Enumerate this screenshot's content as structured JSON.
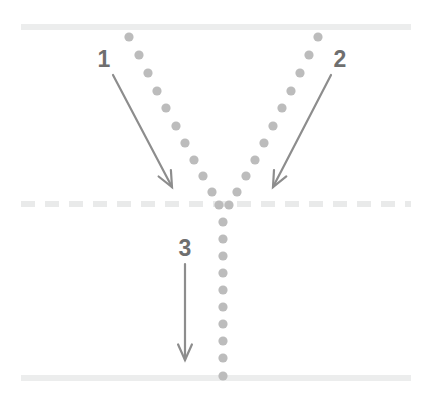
{
  "figure": {
    "title": "",
    "width": 431,
    "height": 402,
    "background": "#ffffff"
  },
  "colors": {
    "guide_line_solid": "#eceded",
    "guide_line_dashed": "#e9eaea",
    "track_dot": "#bcbcbc",
    "arrow": "#8d8d8d",
    "label_text": "#6f6f6f"
  },
  "guide_lines": [
    {
      "name": "top-solid-line",
      "style": "solid",
      "x1": 21,
      "y1": 27,
      "x2": 411,
      "y2": 27,
      "thickness": 6,
      "color": "#eceded"
    },
    {
      "name": "middle-dashed-line",
      "style": "dashed",
      "x1": 21,
      "y1": 204,
      "x2": 411,
      "y2": 204,
      "thickness": 6,
      "color": "#e9eaea",
      "dash": "14 10"
    },
    {
      "name": "bottom-solid-line",
      "style": "solid",
      "x1": 21,
      "y1": 378,
      "x2": 411,
      "y2": 378,
      "thickness": 6,
      "color": "#eceded"
    }
  ],
  "dot_tracks": [
    {
      "name": "left-branch-dot-track",
      "dot_radius": 4.6,
      "color": "#bcbcbc",
      "points": [
        [
          129,
          37
        ],
        [
          139,
          55
        ],
        [
          148,
          73
        ],
        [
          157,
          91
        ],
        [
          166,
          108
        ],
        [
          176,
          126
        ],
        [
          185,
          143
        ],
        [
          194,
          160
        ],
        [
          203,
          176
        ],
        [
          212,
          192
        ],
        [
          219,
          205
        ]
      ]
    },
    {
      "name": "right-branch-dot-track",
      "dot_radius": 4.6,
      "color": "#bcbcbc",
      "points": [
        [
          318,
          37
        ],
        [
          309,
          55
        ],
        [
          300,
          73
        ],
        [
          291,
          91
        ],
        [
          282,
          108
        ],
        [
          273,
          126
        ],
        [
          264,
          143
        ],
        [
          255,
          160
        ],
        [
          246,
          176
        ],
        [
          237,
          192
        ],
        [
          229,
          205
        ]
      ]
    },
    {
      "name": "merged-stem-dot-track",
      "dot_radius": 4.6,
      "color": "#bcbcbc",
      "points": [
        [
          223,
          222
        ],
        [
          223,
          239
        ],
        [
          223,
          256
        ],
        [
          223,
          273
        ],
        [
          223,
          290
        ],
        [
          223,
          307
        ],
        [
          223,
          324
        ],
        [
          223,
          341
        ],
        [
          223,
          358
        ],
        [
          223,
          376
        ]
      ]
    }
  ],
  "annotations": [
    {
      "id": "1",
      "name": "annotation-1",
      "label": "1",
      "label_x": 104,
      "label_y": 67,
      "arrow": {
        "x1": 113,
        "y1": 75,
        "x2": 172,
        "y2": 187
      },
      "head_size": 17
    },
    {
      "id": "2",
      "name": "annotation-2",
      "label": "2",
      "label_x": 340,
      "label_y": 67,
      "arrow": {
        "x1": 331,
        "y1": 75,
        "x2": 273,
        "y2": 187
      },
      "head_size": 17
    },
    {
      "id": "3",
      "name": "annotation-3",
      "label": "3",
      "label_x": 185,
      "label_y": 256,
      "arrow": {
        "x1": 185,
        "y1": 264,
        "x2": 185,
        "y2": 360
      },
      "head_size": 17
    }
  ]
}
